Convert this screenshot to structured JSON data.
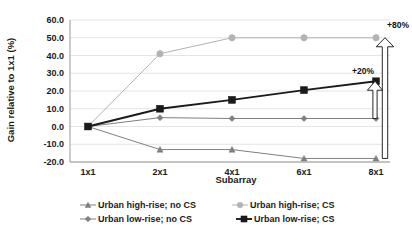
{
  "chart_data": {
    "type": "line",
    "title": "",
    "subtitle": "",
    "xlabel": "Subarray",
    "ylabel": "Gain relative to 1x1 (%)",
    "categories": [
      "1x1",
      "2x1",
      "4x1",
      "6x1",
      "8x1"
    ],
    "ylim": [
      -20.0,
      60.0
    ],
    "ytick_labels": [
      "60.0",
      "50.0",
      "40.0",
      "30.0",
      "20.0",
      "10.0",
      "0.0",
      "-10.0",
      "-20.0"
    ],
    "ytick_values": [
      60.0,
      50.0,
      40.0,
      30.0,
      20.0,
      10.0,
      0.0,
      -10.0,
      -20.0
    ],
    "grid": true,
    "legend_position": "bottom",
    "series": [
      {
        "name": "Urban high-rise; no CS",
        "marker": "triangle",
        "color": "#808080",
        "values": [
          0.0,
          -13.0,
          -13.0,
          -18.0,
          -18.0
        ]
      },
      {
        "name": "Urban high-rise; CS",
        "marker": "circle",
        "color": "#b3b3b3",
        "values": [
          0.0,
          41.0,
          50.0,
          50.0,
          50.0
        ]
      },
      {
        "name": "Urban low-rise; no CS",
        "marker": "diamond",
        "color": "#7f7f7f",
        "values": [
          0.0,
          5.0,
          4.5,
          4.5,
          4.5
        ]
      },
      {
        "name": "Urban low-rise; CS",
        "marker": "square",
        "color": "#1a1a1a",
        "values": [
          0.0,
          10.0,
          15.0,
          20.5,
          25.5
        ]
      }
    ],
    "annotations": [
      {
        "text": "+80%",
        "from_value": -18.0,
        "to_value": 50.0,
        "at_category": "8x1"
      },
      {
        "text": "+20%",
        "from_value": 4.5,
        "to_value": 25.5,
        "at_category": "8x1"
      }
    ]
  },
  "legend": {
    "entries": [
      {
        "label": "Urban high-rise; no CS"
      },
      {
        "label": "Urban high-rise; CS"
      },
      {
        "label": "Urban low-rise; no CS"
      },
      {
        "label": "Urban low-rise; CS"
      }
    ]
  }
}
